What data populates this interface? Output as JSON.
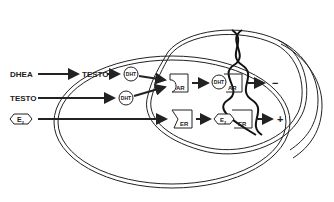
{
  "diagram": {
    "title": "",
    "nodes": {
      "dhea": "DHEA",
      "testo_inner": "TESTO",
      "dht_1": "DHT",
      "testo_outer": "TESTO",
      "dht_2": "DHT",
      "e2": "E",
      "e2_sub": "2",
      "ar": "AR",
      "er": "ER",
      "dht_ar_dht": "DHT",
      "dht_ar_ar": "AR",
      "e2_er_e": "E",
      "e2_er_sub": "2",
      "e2_er_er": "ER"
    },
    "outcomes": {
      "ar_effect": "−",
      "er_effect": "+"
    },
    "structures": [
      "cell-membrane",
      "nucleus",
      "dna-helix"
    ]
  }
}
